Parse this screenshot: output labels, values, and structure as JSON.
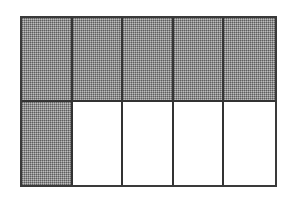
{
  "diagram": {
    "type": "fraction-grid",
    "rows": 2,
    "columns": 5,
    "total_cells": 10,
    "shaded_count": 6,
    "shaded_cells": [
      [
        true,
        true,
        true,
        true,
        true
      ],
      [
        true,
        false,
        false,
        false,
        false
      ]
    ],
    "colors": {
      "shaded": "#8e8e8e",
      "unshaded": "#ffffff",
      "border": "#333333"
    }
  }
}
